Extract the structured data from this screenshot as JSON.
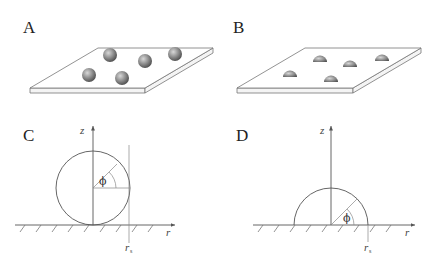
{
  "panels": {
    "a": {
      "label": "A",
      "description": "spheres on plate"
    },
    "b": {
      "label": "B",
      "description": "hemispherical droplets on plate"
    },
    "c": {
      "label": "C",
      "z_label": "z",
      "r_label": "r",
      "rs_label": "r",
      "rs_sub": "s",
      "angle_label": "ϕ"
    },
    "d": {
      "label": "D",
      "z_label": "z",
      "r_label": "r",
      "rs_label": "r",
      "rs_sub": "s",
      "angle_label": "ϕ"
    }
  },
  "colors": {
    "line": "#555555",
    "sphere_light": "#d0d0d0",
    "sphere_dark": "#505050"
  }
}
